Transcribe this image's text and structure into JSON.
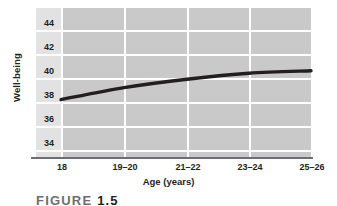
{
  "figure": {
    "caption_prefix": "FIGURE",
    "caption_number": "1.5"
  },
  "chart_data": {
    "type": "line",
    "title": "",
    "xlabel": "Age (years)",
    "ylabel": "Well-being",
    "categories": [
      "18",
      "19–20",
      "21–22",
      "23–24",
      "25–26"
    ],
    "x_tick_labels": [
      "18",
      "19–20",
      "21–22",
      "23–24",
      "25–26"
    ],
    "y_tick_labels": [
      "44",
      "42",
      "40",
      "38",
      "36",
      "34"
    ],
    "y_ticks": [
      44,
      42,
      40,
      38,
      36,
      34
    ],
    "ylim": [
      33,
      45
    ],
    "xlim": [
      0,
      4
    ],
    "grid": true,
    "legend": "none",
    "series": [
      {
        "name": "Well-being",
        "values": [
          38.2,
          39.2,
          39.9,
          40.4,
          40.6
        ]
      }
    ],
    "plot_background": "#c9c9c9",
    "gridline_color": "#ffffff",
    "line_color": "#231f20",
    "line_width": 3
  }
}
